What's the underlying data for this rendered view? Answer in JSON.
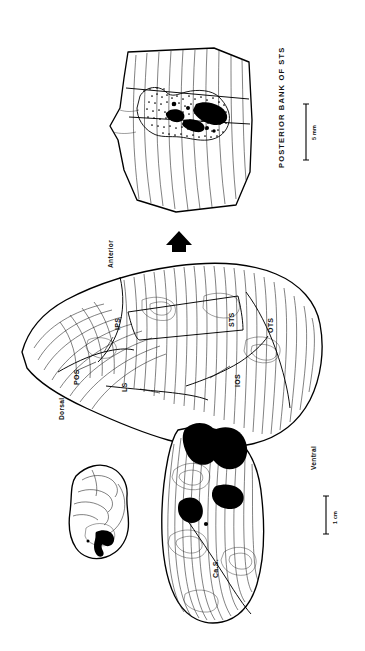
{
  "figure": {
    "type": "scientific-illustration",
    "orientation_note": "Entire plate is printed rotated 90 degrees; all text reads bottom-to-top",
    "background_color": "#ffffff",
    "ink_color": "#000000"
  },
  "panels": {
    "inset_panel": {
      "name": "posterior-bank-sts-panel",
      "title": "POSTERIOR BANK OF STS",
      "description": "Enlarged unfolded map of the posterior bank of the superior temporal sulcus with a stippled label field enclosing a dense black core",
      "features": [
        "vertical contour lines",
        "outlined label field",
        "stippled (dotted) light label",
        "solid black dense label core"
      ]
    },
    "main_panel": {
      "name": "main-flat-map",
      "description": "Large unfolded flat map of occipital, parietal and temporal cortex with contour lines and sulcal fundi",
      "sulci": [
        {
          "abbr": "IPS",
          "full": "intraparietal sulcus"
        },
        {
          "abbr": "POS",
          "full": "parieto-occipital sulcus"
        },
        {
          "abbr": "LS",
          "full": "lunate sulcus"
        },
        {
          "abbr": "STS",
          "full": "superior temporal sulcus"
        },
        {
          "abbr": "IOS",
          "full": "inferior occipital sulcus"
        },
        {
          "abbr": "OTS",
          "full": "occipitotemporal sulcus"
        }
      ],
      "orientation_labels": [
        {
          "label": "Dorsal"
        },
        {
          "label": "Anterior"
        },
        {
          "label": "Ventral"
        }
      ]
    },
    "lower_panel": {
      "name": "calcarine-flat-map",
      "description": "Unfolded map of the operculum and calcarine region bearing several solid black labeled patches",
      "sulci": [
        {
          "abbr": "Ca.S.",
          "full": "calcarine sulcus"
        }
      ],
      "patch_count": 5
    },
    "brain_inset": {
      "name": "whole-brain-inset",
      "description": "Small lateral view outline of the whole hemisphere with a black labeled zone at its occipital pole",
      "patch_count": 1
    }
  },
  "arrow": {
    "name": "magnification-arrow",
    "description": "Solid black arrow linking the main map to the enlarged posterior bank of STS panel",
    "glyph": "arrow-up"
  },
  "scale_bars": [
    {
      "name": "scale-bar-sts-panel",
      "label": "5 mm",
      "applies_to": "POSTERIOR BANK OF STS panel"
    },
    {
      "name": "scale-bar-main-map",
      "label": "1 cm",
      "applies_to": "main flat map and calcarine map"
    }
  ],
  "legend_notes": {
    "solid_black": "dense terminal label",
    "stipple": "light / sparse terminal label",
    "thin_lines": "contours of the unfolded cortical surface",
    "thick_lines": "map border and sulcal fundi"
  }
}
